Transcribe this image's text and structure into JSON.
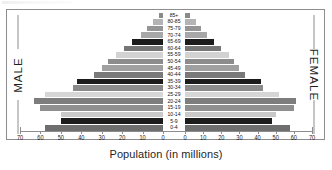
{
  "chart_data": {
    "type": "bar",
    "subtype": "population-pyramid",
    "title": "",
    "xlabel": "Population (in millions)",
    "ylabel": "",
    "orientation": "horizontal-mirrored",
    "grid": false,
    "legend": "none",
    "left_label": "MALE",
    "right_label": "FEMALE",
    "categories": [
      "0-4",
      "5-9",
      "10-14",
      "15-19",
      "20-24",
      "25-29",
      "30-34",
      "35-39",
      "40-44",
      "45-49",
      "50-54",
      "55-59",
      "60-64",
      "65-69",
      "70-74",
      "75-79",
      "80-85",
      "85+"
    ],
    "xlim": [
      0,
      70
    ],
    "xticks": [
      70,
      60,
      50,
      40,
      30,
      20,
      10,
      0
    ],
    "xticks_left": [
      "70",
      "60",
      "50",
      "40",
      "30",
      "20",
      "10",
      "0"
    ],
    "xticks_right": [
      "0",
      "10",
      "20",
      "30",
      "40",
      "50",
      "60",
      "70"
    ],
    "series": [
      {
        "name": "MALE",
        "side": "left",
        "values": [
          58,
          50,
          50,
          60,
          63,
          58,
          44,
          42,
          34,
          30,
          27,
          23,
          19,
          15,
          11,
          8,
          5,
          2
        ]
      },
      {
        "name": "FEMALE",
        "side": "right",
        "values": [
          58,
          48,
          50,
          60,
          61,
          52,
          43,
          42,
          33,
          30,
          27,
          24,
          20,
          16,
          12,
          9,
          6,
          3
        ]
      }
    ],
    "bar_colors": [
      "#6e6e6e",
      "#1c1c1c",
      "#c9c9c9",
      "#8f8f8f",
      "#7d7d7d",
      "#d6d6d6",
      "#8a8a8a",
      "#1c1c1c",
      "#7a7a7a",
      "#a0a0a0",
      "#8c8c8c",
      "#d2d2d2",
      "#767676",
      "#1c1c1c",
      "#a8a8a8",
      "#959595",
      "#b4b4b4",
      "#8a8a8a"
    ]
  },
  "colors": {
    "frame": "#8d8d8d",
    "text": "#1a1a1a",
    "background": "#ffffff"
  }
}
